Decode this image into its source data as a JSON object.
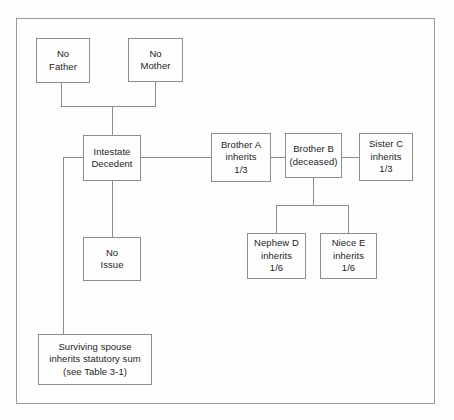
{
  "figure": {
    "type": "family-tree-flowchart",
    "background_color": "#fdfdfd",
    "box_border_color": "#8d8d8d",
    "connector_color": "#8d8d8d",
    "text_color": "#1d1d1d"
  },
  "nodes": {
    "no_father": {
      "lines": [
        "No",
        "Father"
      ]
    },
    "no_mother": {
      "lines": [
        "No",
        "Mother"
      ]
    },
    "decedent": {
      "lines": [
        "Intestate",
        "Decedent"
      ]
    },
    "brother_a": {
      "lines": [
        "Brother A",
        "inherits",
        "1/3"
      ]
    },
    "brother_b": {
      "lines": [
        "Brother B",
        "(deceased)"
      ]
    },
    "sister_c": {
      "lines": [
        "Sister C",
        "inherits",
        "1/3"
      ]
    },
    "no_issue": {
      "lines": [
        "No",
        "Issue"
      ]
    },
    "nephew_d": {
      "lines": [
        "Nephew D",
        "inherits",
        "1/6"
      ]
    },
    "niece_e": {
      "lines": [
        "Niece E",
        "inherits",
        "1/6"
      ]
    },
    "spouse": {
      "lines": [
        "Surviving spouse",
        "inherits statutory sum",
        "(see Table 3-1)"
      ]
    }
  }
}
